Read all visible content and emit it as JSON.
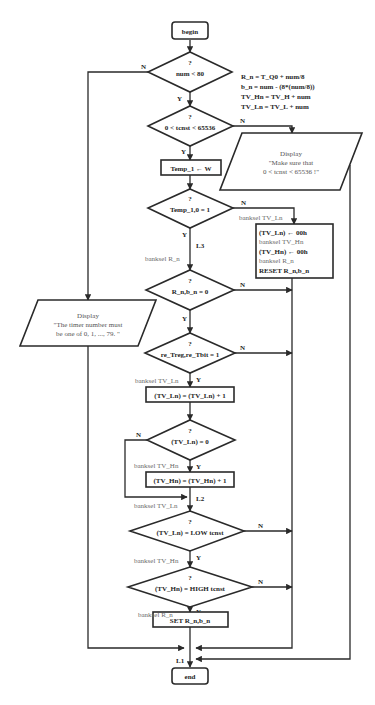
{
  "diagram": {
    "type": "flowchart",
    "terminals": {
      "begin": "begin",
      "end": "end"
    },
    "assignments_note": [
      "R_n =  T_Q0 + num/8",
      "b_n =  num - (8*(num/8))",
      "TV_Hn =  TV_H + num",
      "TV_Ln =  TV_L + num"
    ],
    "decisions": {
      "d1": {
        "q": "?",
        "text": "num  <  80",
        "yes": "Y",
        "no": "N"
      },
      "d2": {
        "q": "?",
        "text": "0 <  tcnst < 65536",
        "yes": "Y",
        "no": "N"
      },
      "d3": {
        "q": "?",
        "text": "Temp_1,0 = 1",
        "yes": "Y",
        "no": "N"
      },
      "d4": {
        "q": "?",
        "text": "R_n,b_n = 0",
        "yes": "Y",
        "no": "N"
      },
      "d5": {
        "q": "?",
        "text": "re_Treg,re_Tbit = 1",
        "yes": "Y",
        "no": "N"
      },
      "d6": {
        "q": "?",
        "text": "(TV_Ln) = 0",
        "yes": "Y",
        "no": "N"
      },
      "d7": {
        "q": "?",
        "text": "(TV_Ln) = LOW tcnst",
        "yes": "Y",
        "no": "N"
      },
      "d8": {
        "q": "?",
        "text": "(TV_Hn) = HIGH tcnst",
        "yes": "Y",
        "no": "N"
      }
    },
    "processes": {
      "temp": "Temp_1 ← W",
      "inc_ln": "(TV_Ln) = (TV_Ln) + 1",
      "inc_hn": "(TV_Hn) = (TV_Hn) + 1",
      "set": "SET  R_n,b_n",
      "reset_lines": [
        {
          "text": "(TV_Ln) ← 00h",
          "bold": true
        },
        {
          "text": "banksel TV_Hn",
          "bold": false
        },
        {
          "text": "(TV_Hn) ← 00h",
          "bold": true
        },
        {
          "text": "banksel R_n",
          "bold": false
        },
        {
          "text": "RESET  R_n,b_n",
          "bold": true
        }
      ]
    },
    "displays": {
      "tcnst": [
        "Display",
        "\"Make sure that",
        "0 < tcnst < 65536 !\""
      ],
      "timer": [
        "Display",
        "\"The timer number must",
        "be one of 0, 1, ..., 79. \""
      ]
    },
    "annotations": {
      "banksel_tvln_top": "banksel TV_Ln",
      "banksel_rn_1": "banksel R_n",
      "banksel_tvln_2": "banksel TV_Ln",
      "banksel_tvhn_1": "banksel TV_Hn",
      "banksel_tvln_3": "banksel TV_Ln",
      "banksel_tvhn_2": "banksel TV_Hn",
      "banksel_rn_2": "banksel R_n"
    },
    "labels": {
      "L1": "L1",
      "L2": "L2",
      "L3": "L3"
    }
  }
}
